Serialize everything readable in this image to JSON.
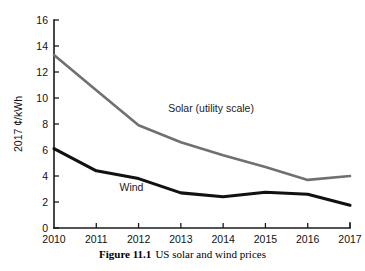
{
  "caption": {
    "figure_number": "Figure 11.1",
    "text": "US solar and wind prices"
  },
  "chart_data": {
    "type": "line",
    "title": "",
    "xlabel": "",
    "ylabel": "2017 ¢/kWh",
    "x": [
      "2010",
      "2011",
      "2012",
      "2013",
      "2014",
      "2015",
      "2016",
      "2017"
    ],
    "xlim": [
      2010,
      2017
    ],
    "ylim": [
      0,
      16
    ],
    "yticks": [
      "0",
      "2",
      "4",
      "6",
      "8",
      "10",
      "12",
      "14",
      "16"
    ],
    "grid": false,
    "legend_position": "inline-annotation",
    "series": [
      {
        "name": "Solar (utility scale)",
        "color": "#707070",
        "width": 2.6,
        "values": [
          13.3,
          10.6,
          7.9,
          6.6,
          5.6,
          4.7,
          3.7,
          4.0
        ],
        "label": "Solar (utility scale)",
        "label_x": 2012.7,
        "label_y": 8.9
      },
      {
        "name": "Wind",
        "color": "#111111",
        "width": 3.1,
        "values": [
          6.1,
          4.4,
          3.8,
          2.7,
          2.4,
          2.75,
          2.6,
          1.75
        ],
        "label": "Wind",
        "label_x": 2011.55,
        "label_y": 2.85
      }
    ]
  }
}
